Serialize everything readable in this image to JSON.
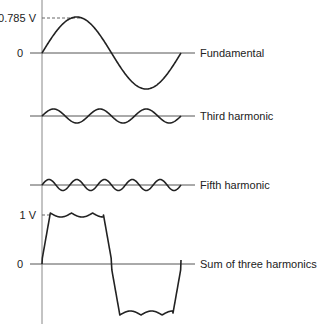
{
  "diagram": {
    "panels": [
      {
        "name": "Fundamental",
        "label": "Fundamental",
        "harmonic": 1,
        "cycles": 1,
        "amplitude_label": "0.785 V",
        "zero_label": "0"
      },
      {
        "name": "Third harmonic",
        "label": "Third harmonic",
        "harmonic": 3,
        "cycles": 3
      },
      {
        "name": "Fifth harmonic",
        "label": "Fifth harmonic",
        "harmonic": 5,
        "cycles": 5
      },
      {
        "name": "Sum of three harmonics",
        "label": "Sum of three harmonics",
        "amplitude_label": "1 V",
        "zero_label": "0"
      }
    ],
    "colors": {
      "wave": "#222222",
      "axis": "#888888",
      "text": "#222222"
    }
  }
}
